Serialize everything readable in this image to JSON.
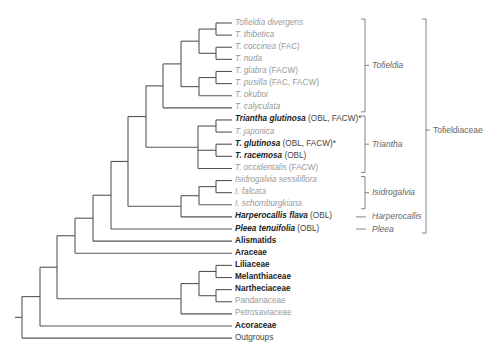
{
  "diagram": {
    "type": "phylogenetic-tree",
    "colors": {
      "branch": "#555555",
      "label_gray": "#a0a0a0",
      "label_bold": "#222222",
      "bracket": "#777777"
    },
    "leaves": [
      {
        "name": "Tofieldia divergens",
        "note": "",
        "style": "gray-italic"
      },
      {
        "name": "T. thibetica",
        "note": "",
        "style": "gray-italic"
      },
      {
        "name": "T. coccinea",
        "note": "(FAC)",
        "style": "gray-italic"
      },
      {
        "name": "T. nuda",
        "note": "",
        "style": "gray-italic"
      },
      {
        "name": "T. glabra",
        "note": "(FACW)",
        "style": "gray-italic"
      },
      {
        "name": "T. pusilla",
        "note": "(FAC, FACW)",
        "style": "gray-italic"
      },
      {
        "name": "T. okuboi",
        "note": "",
        "style": "gray-italic"
      },
      {
        "name": "T. calyculata",
        "note": "",
        "style": "gray-italic"
      },
      {
        "name": "Triantha glutinosa",
        "note": "(OBL, FACW)*",
        "style": "bold-italic"
      },
      {
        "name": "T. japonica",
        "note": "",
        "style": "gray-italic"
      },
      {
        "name": "T. glutinosa",
        "note": "(OBL, FACW)*",
        "style": "bold-italic"
      },
      {
        "name": "T. racemosa",
        "note": "(OBL)",
        "style": "bold-italic"
      },
      {
        "name": "T. occidentalis",
        "note": "(FACW)",
        "style": "gray-italic"
      },
      {
        "name": "Isidrogalvia sessiliflora",
        "note": "",
        "style": "gray-italic"
      },
      {
        "name": "I. falcata",
        "note": "",
        "style": "gray-italic"
      },
      {
        "name": "I. schomburgkiana",
        "note": "",
        "style": "gray-italic"
      },
      {
        "name": "Harperocallis flava",
        "note": "(OBL)",
        "style": "bold-italic"
      },
      {
        "name": "Pleea tenuifolia",
        "note": "(OBL)",
        "style": "bold-italic"
      },
      {
        "name": "Alismatids",
        "note": "",
        "style": "bold"
      },
      {
        "name": "Araceae",
        "note": "",
        "style": "bold"
      },
      {
        "name": "Liliaceae",
        "note": "",
        "style": "bold"
      },
      {
        "name": "Melanthiaceae",
        "note": "",
        "style": "bold"
      },
      {
        "name": "Nartheciaceae",
        "note": "",
        "style": "bold"
      },
      {
        "name": "Pandanaceae",
        "note": "",
        "style": "gray"
      },
      {
        "name": "Petrosaviaceae",
        "note": "",
        "style": "gray"
      },
      {
        "name": "Acoraceae",
        "note": "",
        "style": "bold"
      },
      {
        "name": "Outgroups",
        "note": "",
        "style": "dark"
      }
    ],
    "genus_groups": [
      {
        "label": "Tofieldia",
        "from": 0,
        "to": 7
      },
      {
        "label": "Triantha",
        "from": 8,
        "to": 12
      },
      {
        "label": "Isidrogalvia",
        "from": 13,
        "to": 15
      },
      {
        "label": "Harperocallis",
        "from": 16,
        "to": 16
      },
      {
        "label": "Pleea",
        "from": 17,
        "to": 17
      }
    ],
    "family_group": {
      "label": "Tofieldiaceae",
      "from": 0,
      "to": 17
    }
  }
}
